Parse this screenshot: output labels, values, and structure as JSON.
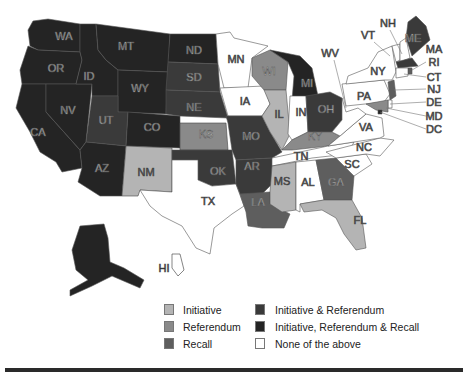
{
  "colors": {
    "initiative": "#b4b4b4",
    "referendum": "#8a8a8a",
    "recall": "#5e5e5e",
    "initiative_referendum": "#3a3a3a",
    "initiative_referendum_recall": "#242424",
    "none": "#ffffff"
  },
  "map": {
    "labels": {
      "WA": "WA",
      "OR": "OR",
      "CA": "CA",
      "NV": "NV",
      "ID": "ID",
      "MT": "MT",
      "WY": "WY",
      "UT": "UT",
      "AZ": "AZ",
      "CO": "CO",
      "NM": "NM",
      "ND": "ND",
      "SD": "SD",
      "NE": "NE",
      "KS": "KS",
      "OK": "OK",
      "TX": "TX",
      "MN": "MN",
      "IA": "IA",
      "MO": "MO",
      "AR": "AR",
      "LA": "LA",
      "WI": "WI",
      "IL": "IL",
      "MI": "MI",
      "IN": "IN",
      "OH": "OH",
      "KY": "KY",
      "TN": "TN",
      "MS": "MS",
      "AL": "AL",
      "GA": "GA",
      "FL": "FL",
      "SC": "SC",
      "NC": "NC",
      "VA": "VA",
      "WV": "WV",
      "PA": "PA",
      "NY": "NY",
      "VT": "VT",
      "NH": "NH",
      "ME": "ME",
      "MA": "MA",
      "RI": "RI",
      "CT": "CT",
      "NJ": "NJ",
      "DE": "DE",
      "MD": "MD",
      "DC": "DC",
      "HI": "HI"
    },
    "categories": {
      "WA": "initiative_referendum_recall",
      "OR": "initiative_referendum_recall",
      "CA": "initiative_referendum_recall",
      "NV": "initiative_referendum_recall",
      "ID": "initiative_referendum_recall",
      "MT": "initiative_referendum_recall",
      "WY": "initiative_referendum_recall",
      "UT": "initiative_referendum",
      "AZ": "initiative_referendum_recall",
      "CO": "initiative_referendum_recall",
      "NM": "initiative",
      "ND": "initiative_referendum_recall",
      "SD": "initiative_referendum",
      "NE": "initiative_referendum",
      "KS": "referendum",
      "OK": "initiative_referendum",
      "TX": "none",
      "MN": "none",
      "IA": "none",
      "MO": "initiative_referendum",
      "AR": "initiative_referendum",
      "LA": "recall",
      "WI": "referendum",
      "IL": "initiative",
      "MI": "initiative_referendum_recall",
      "IN": "none",
      "OH": "initiative_referendum",
      "KY": "referendum",
      "TN": "none",
      "MS": "initiative",
      "AL": "none",
      "GA": "recall",
      "FL": "initiative",
      "SC": "none",
      "NC": "none",
      "VA": "none",
      "WV": "none",
      "PA": "none",
      "NY": "none",
      "VT": "none",
      "NH": "none",
      "ME": "initiative_referendum",
      "MA": "initiative_referendum",
      "RI": "recall",
      "CT": "none",
      "NJ": "recall",
      "DE": "none",
      "MD": "referendum",
      "DC": "initiative_referendum_recall",
      "AK": "initiative_referendum_recall",
      "HI": "none"
    }
  },
  "legend": {
    "items": [
      {
        "label": "Initiative",
        "key": "initiative"
      },
      {
        "label": "Referendum",
        "key": "referendum"
      },
      {
        "label": "Recall",
        "key": "recall"
      },
      {
        "label": "Initiative & Referendum",
        "key": "initiative_referendum"
      },
      {
        "label": "Initiative, Referendum & Recall",
        "key": "initiative_referendum_recall"
      },
      {
        "label": "None of the above",
        "key": "none"
      }
    ]
  }
}
